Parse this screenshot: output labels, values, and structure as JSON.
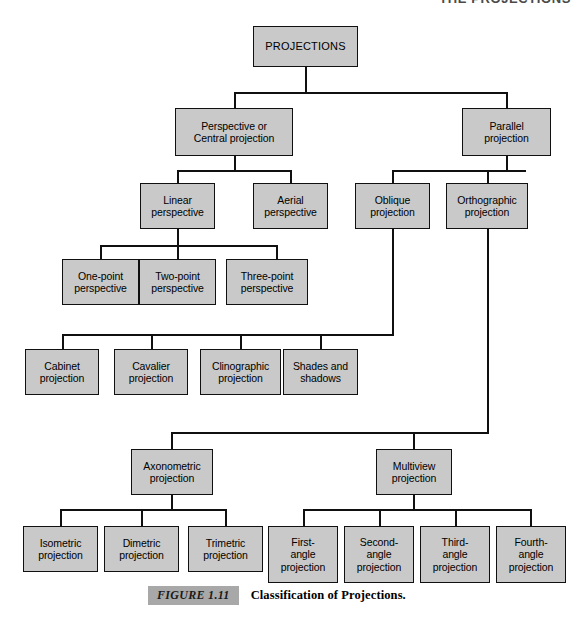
{
  "running_head": "THE PROJECTIONS",
  "caption": {
    "figure_tag": "FIGURE 1.11",
    "title": "Classification of Projections."
  },
  "diagram": {
    "type": "tree",
    "title": "Classification of Projections",
    "nodes": {
      "root": "PROJECTIONS",
      "perspective": "Perspective or\nCentral projection",
      "parallel": "Parallel\nprojection",
      "linear_perspective": "Linear\nperspective",
      "aerial_perspective": "Aerial\nperspective",
      "oblique": "Oblique\nprojection",
      "orthographic": "Orthographic\nprojection",
      "one_point": "One-point\nperspective",
      "two_point": "Two-point\nperspective",
      "three_point": "Three-point\nperspective",
      "cabinet": "Cabinet\nprojection",
      "cavalier": "Cavalier\nprojection",
      "clinographic": "Clinographic\nprojection",
      "shades_shadows": "Shades and\nshadows",
      "axonometric": "Axonometric\nprojection",
      "multiview": "Multiview\nprojection",
      "isometric": "Isometric\nprojection",
      "dimetric": "Dimetric\nprojection",
      "trimetric": "Trimetric\nprojection",
      "first_angle": "First-\nangle\nprojection",
      "second_angle": "Second-\nangle\nprojection",
      "third_angle": "Third-\nangle\nprojection",
      "fourth_angle": "Fourth-\nangle\nprojection"
    },
    "edges": [
      [
        "root",
        "perspective"
      ],
      [
        "root",
        "parallel"
      ],
      [
        "perspective",
        "linear_perspective"
      ],
      [
        "perspective",
        "aerial_perspective"
      ],
      [
        "parallel",
        "oblique"
      ],
      [
        "parallel",
        "orthographic"
      ],
      [
        "linear_perspective",
        "one_point"
      ],
      [
        "linear_perspective",
        "two_point"
      ],
      [
        "linear_perspective",
        "three_point"
      ],
      [
        "oblique",
        "cabinet"
      ],
      [
        "oblique",
        "cavalier"
      ],
      [
        "oblique",
        "clinographic"
      ],
      [
        "oblique",
        "shades_shadows"
      ],
      [
        "orthographic",
        "axonometric"
      ],
      [
        "orthographic",
        "multiview"
      ],
      [
        "axonometric",
        "isometric"
      ],
      [
        "axonometric",
        "dimetric"
      ],
      [
        "axonometric",
        "trimetric"
      ],
      [
        "multiview",
        "first_angle"
      ],
      [
        "multiview",
        "second_angle"
      ],
      [
        "multiview",
        "third_angle"
      ],
      [
        "multiview",
        "fourth_angle"
      ]
    ],
    "colors": {
      "node_fill": "#c9c9c9",
      "node_border": "#101010",
      "line": "#101010",
      "text": "#000000",
      "caption_tag_bg": "#a8a8a8",
      "background": "#ffffff"
    }
  }
}
